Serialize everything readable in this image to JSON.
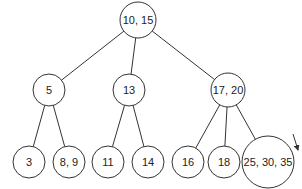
{
  "diagram": {
    "type": "tree",
    "nodes": [
      {
        "id": "root",
        "label": "10, 15",
        "cx": 138,
        "cy": 20,
        "r": 18
      },
      {
        "id": "n5",
        "label": "5",
        "cx": 49,
        "cy": 90,
        "r": 16
      },
      {
        "id": "n13",
        "label": "13",
        "cx": 129,
        "cy": 90,
        "r": 16
      },
      {
        "id": "n17_20",
        "label": "17, 20",
        "cx": 228,
        "cy": 90,
        "r": 17
      },
      {
        "id": "n3",
        "label": "3",
        "cx": 29,
        "cy": 162,
        "r": 16
      },
      {
        "id": "n8_9",
        "label": "8, 9",
        "cx": 69,
        "cy": 162,
        "r": 16
      },
      {
        "id": "n11",
        "label": "11",
        "cx": 108,
        "cy": 162,
        "r": 16
      },
      {
        "id": "n14",
        "label": "14",
        "cx": 148,
        "cy": 162,
        "r": 16
      },
      {
        "id": "n16",
        "label": "16",
        "cx": 188,
        "cy": 162,
        "r": 16
      },
      {
        "id": "n18",
        "label": "18",
        "cx": 224,
        "cy": 162,
        "r": 16
      },
      {
        "id": "n25_30_35",
        "label": "25, 30, 35",
        "cx": 268,
        "cy": 162,
        "r": 26
      }
    ],
    "edges": [
      [
        "root",
        "n5"
      ],
      [
        "root",
        "n13"
      ],
      [
        "root",
        "n17_20"
      ],
      [
        "n5",
        "n3"
      ],
      [
        "n5",
        "n8_9"
      ],
      [
        "n13",
        "n11"
      ],
      [
        "n13",
        "n14"
      ],
      [
        "n17_20",
        "n16"
      ],
      [
        "n17_20",
        "n18"
      ],
      [
        "n17_20",
        "n25_30_35"
      ]
    ],
    "annotation": {
      "type": "arrow",
      "label": "split-indicator-arrow",
      "from": [
        293,
        134
      ],
      "to": [
        298,
        150
      ]
    }
  }
}
